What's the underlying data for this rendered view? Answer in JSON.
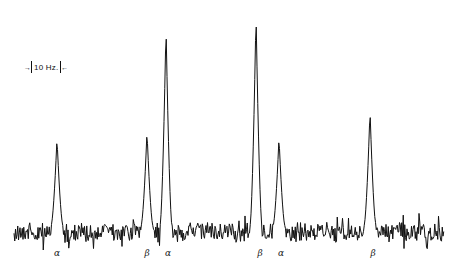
{
  "chart_data": {
    "type": "line",
    "title": "",
    "xlabel": "",
    "ylabel": "",
    "annotations": [
      {
        "text": "10 Hz.",
        "kind": "scale-bar",
        "x_left": 29,
        "x_right": 89,
        "y": 68
      }
    ],
    "baseline_y": 232,
    "noise_amplitude": 10,
    "x_range_px": [
      14,
      444
    ],
    "peaks": [
      {
        "label": "α",
        "x": 57,
        "top_y": 138,
        "width": 6,
        "relative_height": 0.43
      },
      {
        "label": "β",
        "x": 147,
        "top_y": 131,
        "width": 6,
        "relative_height": 0.47
      },
      {
        "label": "α",
        "x": 166,
        "top_y": 26,
        "width": 6,
        "relative_height": 0.94
      },
      {
        "label": "β",
        "x": 256,
        "top_y": 13,
        "width": 6,
        "relative_height": 1.0
      },
      {
        "label": "α",
        "x": 279,
        "top_y": 137,
        "width": 6,
        "relative_height": 0.43
      },
      {
        "label": "β",
        "x": 370,
        "top_y": 110,
        "width": 6,
        "relative_height": 0.56
      }
    ]
  },
  "scale_bar": {
    "text": "10 Hz.",
    "left_arrow": "→",
    "right_arrow": "←"
  },
  "labels": [
    {
      "text": "α",
      "x": 57,
      "y": 248
    },
    {
      "text": "β",
      "x": 147,
      "y": 248
    },
    {
      "text": "α",
      "x": 168,
      "y": 248
    },
    {
      "text": "β",
      "x": 260,
      "y": 248
    },
    {
      "text": "α",
      "x": 281,
      "y": 248
    },
    {
      "text": "β",
      "x": 373,
      "y": 248
    }
  ]
}
